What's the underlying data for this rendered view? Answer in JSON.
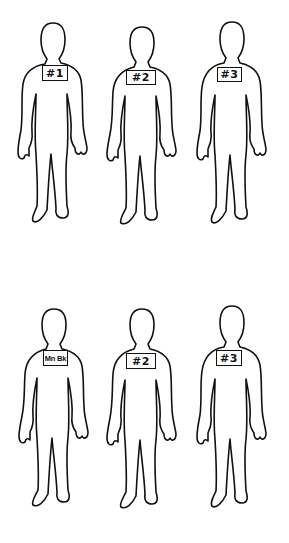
{
  "rows": [
    {
      "figures": [
        {
          "label": "#1"
        },
        {
          "label": "#2"
        },
        {
          "label": "#3"
        }
      ]
    },
    {
      "figures": [
        {
          "label": "Mn Bk"
        },
        {
          "label": "#2"
        },
        {
          "label": "#3"
        }
      ]
    }
  ],
  "colors": {
    "line": "#111111",
    "background": "#ffffff"
  }
}
